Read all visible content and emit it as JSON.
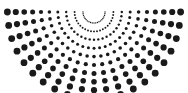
{
  "figure": {
    "width": 188,
    "height": 93,
    "background_color": "#ffffff",
    "dot_color": "#1a1a1a"
  },
  "chart_data": {
    "type": "scatter",
    "title": "",
    "subtitle": "",
    "xlabel": "",
    "ylabel": "",
    "xlim": [
      0,
      188
    ],
    "ylim": [
      0,
      93
    ],
    "grid": false,
    "legend": null,
    "annotations": [],
    "marker": "circle",
    "marker_color": "#1a1a1a",
    "geometry": {
      "apex_x": 94,
      "apex_y": 12,
      "ray_count": 21,
      "angle_start_deg": 0,
      "angle_end_deg": 180,
      "arc_count": 10,
      "radius_min": 11,
      "radius_step": 8.4,
      "dot_size_min": 0.7,
      "dot_size_max": 3.4
    },
    "tick_labels": {
      "x": [],
      "y": []
    },
    "series": [
      {
        "name": "ray-0",
        "angle_deg": 0,
        "x": [
          105,
          113.4,
          121.8,
          130.2,
          138.6,
          147,
          155.4,
          163.8,
          172.2,
          180.6
        ],
        "y": [
          12,
          12,
          12,
          12,
          12,
          12,
          12,
          12,
          12,
          12
        ],
        "sizes": [
          0.7,
          0.95,
          1.2,
          1.5,
          1.8,
          2.1,
          2.5,
          2.8,
          3.1,
          3.4
        ]
      },
      {
        "name": "ray-1",
        "angle_deg": 9,
        "x": [
          104.9,
          113.2,
          121.4,
          129.7,
          138,
          146.2,
          154.5,
          162.7,
          171,
          179.3
        ],
        "y": [
          13.7,
          15.0,
          16.3,
          17.6,
          18.9,
          20.2,
          21.5,
          22.8,
          24.1,
          25.4
        ],
        "sizes": [
          0.7,
          0.95,
          1.2,
          1.5,
          1.8,
          2.1,
          2.5,
          2.8,
          3.1,
          3.4
        ]
      },
      {
        "name": "ray-2",
        "angle_deg": 18,
        "x": [
          104.5,
          112.5,
          120.5,
          128.5,
          136.4,
          144.4,
          152.4,
          160.4,
          168.4,
          176.3
        ],
        "y": [
          15.4,
          18.0,
          20.6,
          23.2,
          25.7,
          28.3,
          30.9,
          33.5,
          36.1,
          38.6
        ],
        "sizes": [
          0.7,
          0.95,
          1.2,
          1.5,
          1.8,
          2.1,
          2.5,
          2.8,
          3.1,
          3.4
        ]
      },
      {
        "name": "ray-3",
        "angle_deg": 27,
        "x": [
          103.8,
          111.3,
          118.8,
          126.2,
          133.7,
          141.2,
          148.6,
          156.1,
          163.6,
          171
        ],
        "y": [
          17.0,
          20.8,
          24.6,
          28.4,
          32.2,
          36.0,
          39.8,
          43.6,
          47.4,
          51.2
        ],
        "sizes": [
          0.7,
          0.95,
          1.2,
          1.5,
          1.8,
          2.1,
          2.5,
          2.8,
          3.1,
          3.4
        ]
      },
      {
        "name": "ray-4",
        "angle_deg": 36,
        "x": [
          102.9,
          109.7,
          116.5,
          123.2,
          130,
          136.8,
          143.6,
          150.4,
          157.2,
          164
        ],
        "y": [
          18.5,
          23.4,
          28.3,
          33.2,
          38.1,
          43.1,
          48.0,
          52.9,
          57.8,
          62.7
        ],
        "sizes": [
          0.7,
          0.95,
          1.2,
          1.5,
          1.8,
          2.1,
          2.5,
          2.8,
          3.1,
          3.4
        ]
      },
      {
        "name": "ray-5",
        "angle_deg": 45,
        "x": [
          101.8,
          107.7,
          113.7,
          119.6,
          125.5,
          131.4,
          137.4,
          143.3,
          149.2,
          155.2
        ],
        "y": [
          19.8,
          25.7,
          31.7,
          37.6,
          43.5,
          49.4,
          55.4,
          61.3,
          67.2,
          73.2
        ],
        "sizes": [
          0.7,
          0.95,
          1.2,
          1.5,
          1.8,
          2.1,
          2.5,
          2.8,
          3.1,
          3.4
        ]
      },
      {
        "name": "ray-6",
        "angle_deg": 54,
        "x": [
          100.5,
          105.4,
          110.4,
          115.3,
          120.2,
          125.1,
          130,
          135,
          139.9,
          144.8
        ],
        "y": [
          20.9,
          27.7,
          34.5,
          41.2,
          48.0,
          54.8,
          61.6,
          68.4,
          75.2,
          82.0
        ],
        "sizes": [
          0.7,
          0.95,
          1.2,
          1.5,
          1.8,
          2.1,
          2.5,
          2.8,
          3.1,
          3.4
        ]
      },
      {
        "name": "ray-7",
        "angle_deg": 63,
        "x": [
          99.0,
          102.8,
          106.6,
          110.4,
          114.3,
          118.1,
          121.9,
          125.7,
          129.5,
          133.3
        ],
        "y": [
          21.8,
          29.3,
          36.8,
          44.2,
          51.7,
          59.2,
          66.6,
          74.1,
          81.6,
          89.0
        ],
        "sizes": [
          0.7,
          0.95,
          1.2,
          1.5,
          1.8,
          2.1,
          2.5,
          2.8,
          3.1,
          3.4
        ]
      },
      {
        "name": "ray-8",
        "angle_deg": 72,
        "x": [
          97.4,
          100.0,
          102.6,
          105.2,
          107.7,
          110.3,
          112.9,
          115.5,
          118.1,
          120.6
        ],
        "y": [
          22.5,
          30.5,
          38.5,
          46.5,
          54.4,
          62.4,
          70.4,
          78.4,
          86.4,
          94.3
        ],
        "sizes": [
          0.7,
          0.95,
          1.2,
          1.5,
          1.8,
          2.1,
          2.5,
          2.8,
          3.1,
          3.4
        ]
      },
      {
        "name": "ray-9",
        "angle_deg": 81,
        "x": [
          95.7,
          97.0,
          98.3,
          99.6,
          100.9,
          102.2,
          103.5,
          104.8,
          106.1,
          107.4
        ],
        "y": [
          22.9,
          31.2,
          39.4,
          47.7,
          56.0,
          64.2,
          72.5,
          80.8,
          89.1,
          97.3
        ],
        "sizes": [
          0.7,
          0.95,
          1.2,
          1.5,
          1.8,
          2.1,
          2.5,
          2.8,
          3.1,
          3.4
        ]
      },
      {
        "name": "ray-10",
        "angle_deg": 90,
        "x": [
          94,
          94,
          94,
          94,
          94,
          94,
          94,
          94,
          94,
          94
        ],
        "y": [
          23,
          31.4,
          39.8,
          48.2,
          56.6,
          65,
          73.4,
          81.8,
          90.2,
          98.6
        ],
        "sizes": [
          0.7,
          0.95,
          1.2,
          1.5,
          1.8,
          2.1,
          2.5,
          2.8,
          3.1,
          3.4
        ]
      },
      {
        "name": "ray-11",
        "angle_deg": 99,
        "x": [
          92.3,
          91.0,
          89.7,
          88.4,
          87.1,
          85.8,
          84.5,
          83.2,
          81.9,
          80.6
        ],
        "y": [
          22.9,
          31.2,
          39.4,
          47.7,
          56.0,
          64.2,
          72.5,
          80.8,
          89.1,
          97.3
        ],
        "sizes": [
          0.7,
          0.95,
          1.2,
          1.5,
          1.8,
          2.1,
          2.5,
          2.8,
          3.1,
          3.4
        ]
      },
      {
        "name": "ray-12",
        "angle_deg": 108,
        "x": [
          90.6,
          88.0,
          85.4,
          82.8,
          80.3,
          77.7,
          75.1,
          72.5,
          69.9,
          67.4
        ],
        "y": [
          22.5,
          30.5,
          38.5,
          46.5,
          54.4,
          62.4,
          70.4,
          78.4,
          86.4,
          94.3
        ],
        "sizes": [
          0.7,
          0.95,
          1.2,
          1.5,
          1.8,
          2.1,
          2.5,
          2.8,
          3.1,
          3.4
        ]
      },
      {
        "name": "ray-13",
        "angle_deg": 117,
        "x": [
          89.0,
          85.2,
          81.4,
          77.6,
          73.7,
          69.9,
          66.1,
          62.3,
          58.5,
          54.7
        ],
        "y": [
          21.8,
          29.3,
          36.8,
          44.2,
          51.7,
          59.2,
          66.6,
          74.1,
          81.6,
          89.0
        ],
        "sizes": [
          0.7,
          0.95,
          1.2,
          1.5,
          1.8,
          2.1,
          2.5,
          2.8,
          3.1,
          3.4
        ]
      },
      {
        "name": "ray-14",
        "angle_deg": 126,
        "x": [
          87.5,
          82.6,
          77.6,
          72.7,
          67.8,
          62.9,
          58.0,
          53.0,
          48.1,
          43.2
        ],
        "y": [
          20.9,
          27.7,
          34.5,
          41.2,
          48.0,
          54.8,
          61.6,
          68.4,
          75.2,
          82.0
        ],
        "sizes": [
          0.7,
          0.95,
          1.2,
          1.5,
          1.8,
          2.1,
          2.5,
          2.8,
          3.1,
          3.4
        ]
      },
      {
        "name": "ray-15",
        "angle_deg": 135,
        "x": [
          86.2,
          80.3,
          74.3,
          68.4,
          62.5,
          56.6,
          50.6,
          44.7,
          38.8,
          32.8
        ],
        "y": [
          19.8,
          25.7,
          31.7,
          37.6,
          43.5,
          49.4,
          55.4,
          61.3,
          67.2,
          73.2
        ],
        "sizes": [
          0.7,
          0.95,
          1.2,
          1.5,
          1.8,
          2.1,
          2.5,
          2.8,
          3.1,
          3.4
        ]
      },
      {
        "name": "ray-16",
        "angle_deg": 144,
        "x": [
          85.1,
          78.3,
          71.5,
          64.8,
          58.0,
          51.2,
          44.4,
          37.6,
          30.8,
          24.0
        ],
        "y": [
          18.5,
          23.4,
          28.3,
          33.2,
          38.1,
          43.1,
          48.0,
          52.9,
          57.8,
          62.7
        ],
        "sizes": [
          0.7,
          0.95,
          1.2,
          1.5,
          1.8,
          2.1,
          2.5,
          2.8,
          3.1,
          3.4
        ]
      },
      {
        "name": "ray-17",
        "angle_deg": 153,
        "x": [
          84.2,
          76.7,
          69.2,
          61.8,
          54.3,
          46.8,
          39.4,
          31.9,
          24.4,
          17.0
        ],
        "y": [
          17.0,
          20.8,
          24.6,
          28.4,
          32.2,
          36.0,
          39.8,
          43.6,
          47.4,
          51.2
        ],
        "sizes": [
          0.7,
          0.95,
          1.2,
          1.5,
          1.8,
          2.1,
          2.5,
          2.8,
          3.1,
          3.4
        ]
      },
      {
        "name": "ray-18",
        "angle_deg": 162,
        "x": [
          83.5,
          75.5,
          67.5,
          59.5,
          51.6,
          43.6,
          35.6,
          27.6,
          19.6,
          11.7
        ],
        "y": [
          15.4,
          18.0,
          20.6,
          23.2,
          25.7,
          28.3,
          30.9,
          33.5,
          36.1,
          38.6
        ],
        "sizes": [
          0.7,
          0.95,
          1.2,
          1.5,
          1.8,
          2.1,
          2.5,
          2.8,
          3.1,
          3.4
        ]
      },
      {
        "name": "ray-19",
        "angle_deg": 171,
        "x": [
          83.1,
          74.8,
          66.6,
          58.3,
          50.0,
          41.8,
          33.5,
          25.3,
          17.0,
          8.7
        ],
        "y": [
          13.7,
          15.0,
          16.3,
          17.6,
          18.9,
          20.2,
          21.5,
          22.8,
          24.1,
          25.4
        ],
        "sizes": [
          0.7,
          0.95,
          1.2,
          1.5,
          1.8,
          2.1,
          2.5,
          2.8,
          3.1,
          3.4
        ]
      },
      {
        "name": "ray-20",
        "angle_deg": 180,
        "x": [
          83,
          74.6,
          66.2,
          57.8,
          49.4,
          41,
          32.6,
          24.2,
          15.8,
          7.4
        ],
        "y": [
          12,
          12,
          12,
          12,
          12,
          12,
          12,
          12,
          12,
          12
        ],
        "sizes": [
          0.7,
          0.95,
          1.2,
          1.5,
          1.8,
          2.1,
          2.5,
          2.8,
          3.1,
          3.4
        ]
      }
    ]
  }
}
